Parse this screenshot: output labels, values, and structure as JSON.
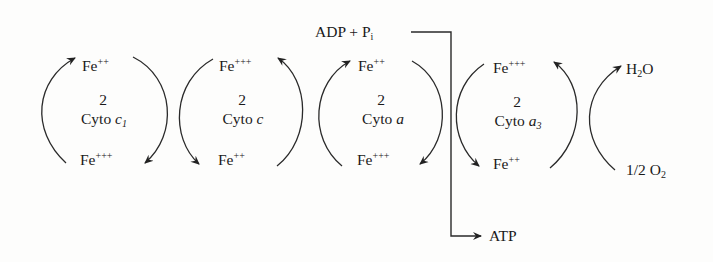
{
  "diagram": {
    "type": "electron-transport-chain-cycles",
    "cycles": [
      {
        "id": "cyto-c1",
        "count": "2",
        "name": "Cyto",
        "subscript_name": "c",
        "subscript": "1",
        "top": "Fe",
        "top_charge": "++",
        "bottom": "Fe",
        "bottom_charge": "+++"
      },
      {
        "id": "cyto-c",
        "count": "2",
        "name": "Cyto",
        "subscript_name": "c",
        "subscript": "",
        "top": "Fe",
        "top_charge": "+++",
        "bottom": "Fe",
        "bottom_charge": "++"
      },
      {
        "id": "cyto-a",
        "count": "2",
        "name": "Cyto",
        "subscript_name": "a",
        "subscript": "",
        "top": "Fe",
        "top_charge": "++",
        "bottom": "Fe",
        "bottom_charge": "+++"
      },
      {
        "id": "cyto-a3",
        "count": "2",
        "name": "Cyto",
        "subscript_name": "a",
        "subscript": "3",
        "top": "Fe",
        "top_charge": "+++",
        "bottom": "Fe",
        "bottom_charge": "++"
      }
    ],
    "oxygen": {
      "product": "H",
      "product_sub": "2",
      "product_tail": "O",
      "reactant": "1/2 O",
      "reactant_sub": "2"
    },
    "phosphorylation": {
      "input": "ADP + P",
      "input_sub": "i",
      "output": "ATP"
    }
  }
}
